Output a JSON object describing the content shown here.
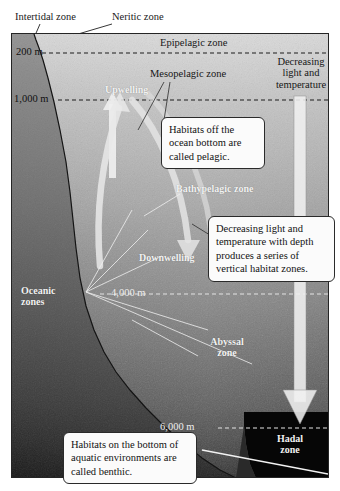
{
  "figure": {
    "frame": {
      "border_color": "#252525",
      "background_top": "#d8d8d8",
      "background_bottom": "#212121"
    }
  },
  "external_labels": [
    {
      "name": "intertidal",
      "text": "Intertidal zone"
    },
    {
      "name": "neritic",
      "text": "Neritic zone"
    }
  ],
  "pelagic_zones": [
    {
      "name": "epipelagic",
      "text": "Epipelagic zone",
      "style": "dark"
    },
    {
      "name": "mesopelagic",
      "text": "Mesopelagic zone",
      "style": "dark"
    },
    {
      "name": "bathypelagic",
      "text": "Bathypelagic zone",
      "style": "white"
    },
    {
      "name": "abyssal",
      "text": "Abyssal",
      "text_line2": "zone",
      "style": "white"
    },
    {
      "name": "hadal",
      "text": "Hadal",
      "text_line2": "zone",
      "style": "white"
    }
  ],
  "depth_markers": [
    {
      "name": "depth-200",
      "label": "200 m",
      "style": "dark"
    },
    {
      "name": "depth-1000",
      "label": "1,000 m",
      "style": "dark"
    },
    {
      "name": "depth-4000",
      "label": "4,000 m",
      "style": "white"
    },
    {
      "name": "depth-6000",
      "label": "6,000 m",
      "style": "white"
    }
  ],
  "currents": [
    {
      "name": "upwelling",
      "text": "Upwelling"
    },
    {
      "name": "downwelling",
      "text": "Downwelling"
    }
  ],
  "oceanic_zones_label": {
    "line1": "Oceanic",
    "line2": "zones"
  },
  "gradient_arrow": {
    "line1": "Decreasing",
    "line2": "light and",
    "line3": "temperature"
  },
  "callouts": [
    {
      "name": "pelagic",
      "text": "Habitats off the ocean bottom are called pelagic."
    },
    {
      "name": "vertical-zones",
      "text": "Decreasing light and temperature with depth produces a series of vertical habitat zones."
    },
    {
      "name": "benthic",
      "text": "Habitats on the bottom of aquatic environments are called benthic."
    }
  ]
}
